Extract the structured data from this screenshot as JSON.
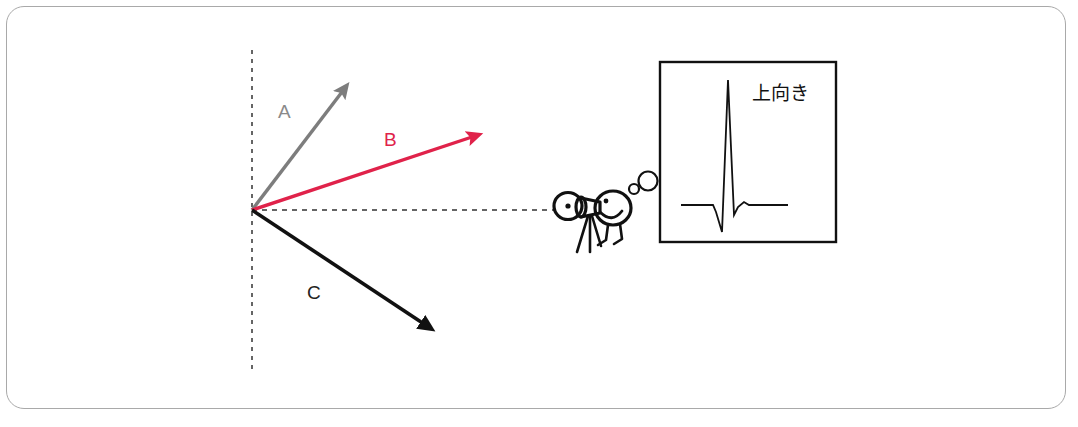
{
  "figure": {
    "background_color": "#ffffff",
    "frame_color": "#a9a9a9"
  },
  "axes": {
    "vertical_dashed_line": {
      "name": "vertical-reference-axis",
      "x": 252,
      "y_top": 50,
      "y_bottom": 372,
      "color": "#333333",
      "dash": "4 5"
    },
    "horizontal_dashed_line": {
      "name": "line-of-sight-axis",
      "y": 210,
      "x_start": 252,
      "x_end": 556,
      "color": "#333333",
      "dash": "5 5"
    },
    "origin": {
      "x": 252,
      "y": 210
    }
  },
  "vectors": [
    {
      "id": "A",
      "label": "A",
      "color": "#7d7d7d",
      "label_color": "#8a8a8a",
      "start": {
        "x": 252,
        "y": 210
      },
      "end": {
        "x": 348,
        "y": 84
      },
      "label_pos": {
        "x": 278,
        "y": 118
      },
      "width": 3.4,
      "angle_deg_from_horizontal": 52.7
    },
    {
      "id": "B",
      "label": "B",
      "color": "#e0224a",
      "label_color": "#e0224a",
      "start": {
        "x": 252,
        "y": 210
      },
      "end": {
        "x": 481,
        "y": 134
      },
      "label_pos": {
        "x": 384,
        "y": 146
      },
      "width": 3.4,
      "angle_deg_from_horizontal": 18.4
    },
    {
      "id": "C",
      "label": "C",
      "color": "#111111",
      "label_color": "#222222",
      "start": {
        "x": 252,
        "y": 210
      },
      "end": {
        "x": 433,
        "y": 330
      },
      "label_pos": {
        "x": 307,
        "y": 299
      },
      "width": 3.6,
      "angle_deg_from_horizontal": -33.5
    }
  ],
  "observer": {
    "name": "person-with-telescope",
    "color": "#111111",
    "eyepiece_center": {
      "x": 568,
      "y": 206
    },
    "head_center": {
      "x": 613,
      "y": 208
    }
  },
  "thought_bubbles": [
    {
      "cx": 634,
      "cy": 189,
      "r": 5.0
    },
    {
      "cx": 648,
      "cy": 181,
      "r": 9.5
    }
  ],
  "waveform_box": {
    "name": "ecg-waveform-panel",
    "x": 660,
    "y": 62,
    "width": 176,
    "height": 180,
    "border_color": "#111111",
    "border_width": 2.4,
    "annotation": "上向き",
    "annotation_pos": {
      "x": 752,
      "y": 100
    },
    "waveform": {
      "name": "qrs-complex-upward",
      "stroke_color": "#111111",
      "stroke_width": 1.8,
      "baseline_y": 205,
      "points": [
        [
          681,
          205
        ],
        [
          713,
          205
        ],
        [
          716,
          212
        ],
        [
          722,
          232
        ],
        [
          728,
          80
        ],
        [
          734,
          215
        ],
        [
          738,
          207
        ],
        [
          744,
          202
        ],
        [
          749,
          205
        ],
        [
          788,
          205
        ]
      ]
    }
  }
}
